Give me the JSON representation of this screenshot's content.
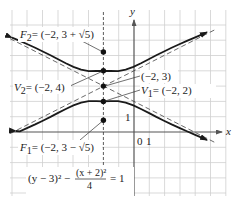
{
  "diagram": {
    "equation": {
      "left": "(y − 3)² −",
      "fraction_numerator": "(x + 2)²",
      "fraction_denominator": "4",
      "right": "= 1"
    },
    "axes": {
      "x_label": "x",
      "y_label": "y",
      "origin_label": "0",
      "x_tick_label": "1",
      "y_tick_label": "1"
    },
    "points": {
      "F2": {
        "label_name": "F",
        "label_sub": "2",
        "label_value": "= (−2, 3 + √5)",
        "x": -2,
        "y": 5.236
      },
      "V2": {
        "label_name": "V",
        "label_sub": "2",
        "label_value": "= (−2, 4)",
        "x": -2,
        "y": 4
      },
      "center": {
        "label_value": "(−2, 3)",
        "x": -2,
        "y": 3
      },
      "V1": {
        "label_name": "V",
        "label_sub": "1",
        "label_value": "= (−2, 2)",
        "x": -2,
        "y": 2
      },
      "F1": {
        "label_name": "F",
        "label_sub": "1",
        "label_value": "= (−2, 3 − √5)",
        "x": -2,
        "y": 0.764
      }
    },
    "asymptotes": [
      "y − 3 = (x + 2)/2",
      "y − 3 = −(x + 2)/2"
    ],
    "colors": {
      "curve": "#1a1a1a",
      "grid": "#cfcfcf",
      "axis": "#555555"
    }
  }
}
